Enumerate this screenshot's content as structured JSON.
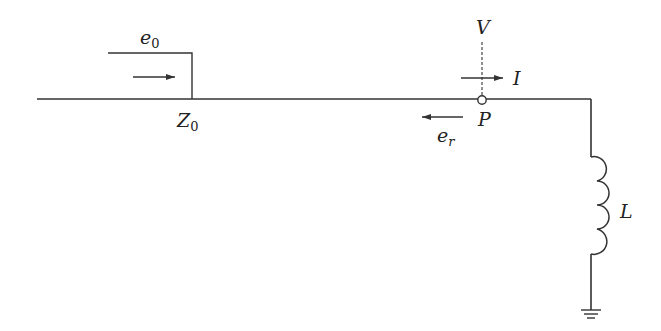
{
  "diagram": {
    "type": "circuit",
    "labels": {
      "incident_wave": "e",
      "incident_wave_sub": "0",
      "surge_impedance": "Z",
      "surge_impedance_sub": "0",
      "reflected_wave": "e",
      "reflected_wave_sub": "r",
      "voltage": "V",
      "current": "I",
      "node": "P",
      "inductor": "L"
    },
    "colors": {
      "line": "#333333",
      "text": "#222222",
      "background": "#ffffff"
    }
  }
}
